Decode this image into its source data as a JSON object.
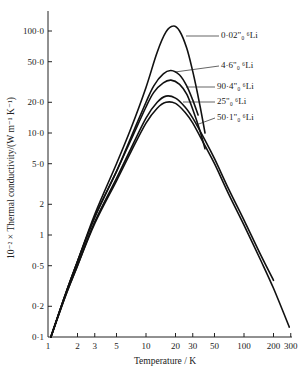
{
  "chart_data": {
    "type": "line",
    "title": "",
    "xlabel": "Temperature / K",
    "ylabel": "10^-2 × Thermal conductivity/(W m^-1 K^-1)",
    "ylabel_display": "10⁻² × Thermal conductivity/(W m⁻¹ K⁻¹)",
    "xscale": "log",
    "yscale": "log",
    "xlim": [
      1,
      300
    ],
    "ylim": [
      0.1,
      140
    ],
    "grid": false,
    "legend_position": "inline-right (leader lines)",
    "x_ticks": [
      1,
      2,
      3,
      5,
      10,
      20,
      30,
      50,
      100,
      200,
      300
    ],
    "x_tick_labels": [
      "1",
      "2",
      "3",
      "5",
      "10",
      "20",
      "30",
      "50",
      "100",
      "200",
      "300"
    ],
    "y_ticks": [
      0.1,
      0.2,
      0.5,
      1,
      2,
      5,
      10,
      20,
      50,
      100
    ],
    "y_tick_labels": [
      "0·1",
      "0·2",
      "0·5",
      "1",
      "2",
      "5·0",
      "10·0",
      "20·0",
      "50·0",
      "100·0"
    ],
    "series": [
      {
        "name": "0·02% ⁶Li",
        "label": "0·02\"₀ ⁶Li",
        "x": [
          1.07,
          1.5,
          2,
          3,
          5,
          7,
          10,
          13,
          16,
          19,
          22,
          26,
          30,
          35,
          40
        ],
        "y": [
          0.1,
          0.26,
          0.55,
          1.6,
          5.0,
          11,
          28,
          62,
          98,
          112,
          100,
          68,
          40,
          20,
          10
        ]
      },
      {
        "name": "4·6% ⁶Li",
        "label": "4·6\"₀ ⁶Li",
        "x": [
          1.07,
          1.5,
          2,
          3,
          5,
          7,
          10,
          12,
          15,
          18,
          22,
          26,
          30,
          34
        ],
        "y": [
          0.1,
          0.26,
          0.55,
          1.5,
          4.2,
          9,
          20,
          29,
          38,
          41,
          37,
          29,
          21,
          15
        ]
      },
      {
        "name": "90·4% ⁶Li",
        "label": "90·4\"₀ ⁶Li",
        "x": [
          1.07,
          1.5,
          2,
          3,
          5,
          7,
          10,
          12,
          15,
          18,
          22,
          26,
          30,
          35,
          40
        ],
        "y": [
          0.1,
          0.26,
          0.55,
          1.5,
          4.2,
          8.5,
          18,
          25,
          31,
          33,
          30,
          24,
          17,
          11,
          7
        ]
      },
      {
        "name": "25% ⁶Li",
        "label": "25\"₀ ⁶Li",
        "x": [
          1.07,
          1.5,
          2,
          3,
          5,
          7,
          10,
          13,
          16,
          20,
          25,
          30,
          40,
          50,
          70,
          100,
          150,
          200
        ],
        "y": [
          0.1,
          0.25,
          0.5,
          1.35,
          3.6,
          7,
          14,
          20,
          23,
          22,
          18,
          14,
          8.5,
          5.6,
          2.8,
          1.4,
          0.62,
          0.36
        ]
      },
      {
        "name": "50·1% ⁶Li",
        "label": "50·1\"₀ ⁶Li",
        "x": [
          1.07,
          1.5,
          2,
          3,
          5,
          7,
          10,
          13,
          16,
          20,
          25,
          30,
          40,
          50,
          70,
          100,
          150,
          200,
          290
        ],
        "y": [
          0.1,
          0.25,
          0.5,
          1.3,
          3.4,
          6.5,
          12.5,
          17.5,
          20,
          19.5,
          16,
          12.5,
          7.5,
          5.0,
          2.5,
          1.25,
          0.55,
          0.3,
          0.125
        ]
      }
    ],
    "annotations": [
      {
        "text": "0·02\"₀ ⁶Li",
        "series": "0·02% ⁶Li"
      },
      {
        "text": "4·6\"₀ ⁶Li",
        "series": "4·6% ⁶Li"
      },
      {
        "text": "90·4\"₀ ⁶Li",
        "series": "90·4% ⁶Li"
      },
      {
        "text": "25\"₀ ⁶Li",
        "series": "25% ⁶Li"
      },
      {
        "text": "50·1\"₀ ⁶Li",
        "series": "50·1% ⁶Li"
      }
    ]
  },
  "legend": {
    "items": [
      {
        "label": "0·02\"₀ ⁶Li",
        "text_x": 221,
        "text_y": 38,
        "leader_from": [
          186,
          36
        ],
        "leader_to": [
          219,
          36
        ]
      },
      {
        "label": "4·6\"₀ ⁶Li",
        "text_x": 221,
        "text_y": 68,
        "leader_from": [
          175,
          72
        ],
        "leader_to": [
          219,
          66
        ]
      },
      {
        "label": "90·4\"₀ ⁶Li",
        "text_x": 217,
        "text_y": 89,
        "leader_from": [
          186,
          87
        ],
        "leader_to": [
          215,
          87
        ]
      },
      {
        "label": "25\"₀ ⁶Li",
        "text_x": 217,
        "text_y": 104,
        "leader_from": [
          183,
          102
        ],
        "leader_to": [
          215,
          102
        ]
      },
      {
        "label": "50·1\"₀ ⁶Li",
        "text_x": 217,
        "text_y": 120,
        "leader_from": [
          196,
          125
        ],
        "leader_to": [
          215,
          118
        ]
      }
    ]
  }
}
